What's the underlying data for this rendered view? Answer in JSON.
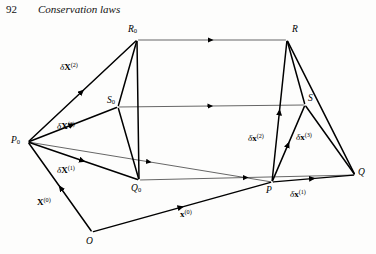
{
  "page": {
    "number": "92",
    "running_head": "Conservation laws",
    "background_color": "#fdfdfc",
    "ink_color": "#000000"
  },
  "figure": {
    "name": "deformation-parallelepiped-diagram",
    "type": "vector-diagram",
    "vertices": [
      {
        "id": "P0",
        "label": "P",
        "subscript": "0",
        "x": 28,
        "y": 142,
        "label_x": 11,
        "label_y": 136
      },
      {
        "id": "Q0",
        "label": "Q",
        "subscript": "0",
        "x": 139,
        "y": 180,
        "label_x": 131,
        "label_y": 184
      },
      {
        "id": "R0",
        "label": "R",
        "subscript": "0",
        "x": 137,
        "y": 40,
        "label_x": 128,
        "label_y": 25
      },
      {
        "id": "S0",
        "label": "S",
        "subscript": "0",
        "x": 118,
        "y": 107,
        "label_x": 107,
        "label_y": 96
      },
      {
        "id": "P",
        "label": "P",
        "subscript": "",
        "x": 272,
        "y": 182,
        "label_x": 266,
        "label_y": 186
      },
      {
        "id": "Q",
        "label": "Q",
        "subscript": "",
        "x": 355,
        "y": 175,
        "label_x": 358,
        "label_y": 168
      },
      {
        "id": "R",
        "label": "R",
        "subscript": "",
        "x": 287,
        "y": 40,
        "label_x": 292,
        "label_y": 25
      },
      {
        "id": "S",
        "label": "S",
        "subscript": "",
        "x": 305,
        "y": 105,
        "label_x": 308,
        "label_y": 94
      },
      {
        "id": "O",
        "label": "O",
        "subscript": "",
        "x": 92,
        "y": 232,
        "label_x": 86,
        "label_y": 237
      }
    ],
    "vector_labels": [
      {
        "id": "dX2",
        "delta": "δ",
        "symbol": "X",
        "superscript": "(2)",
        "x": 60,
        "y": 62,
        "bold": true
      },
      {
        "id": "dX3",
        "delta": "δ",
        "symbol": "X",
        "superscript": "(3)",
        "x": 57,
        "y": 121,
        "bold": true
      },
      {
        "id": "dX1",
        "delta": "δ",
        "symbol": "X",
        "superscript": "(1)",
        "x": 57,
        "y": 165,
        "bold": true
      },
      {
        "id": "X0",
        "delta": "",
        "symbol": "X",
        "superscript": "(0)",
        "x": 37,
        "y": 197,
        "bold": true
      },
      {
        "id": "dx2",
        "delta": "δ",
        "symbol": "x",
        "superscript": "(2)",
        "x": 248,
        "y": 133,
        "bold": true
      },
      {
        "id": "dx3",
        "delta": "δ",
        "symbol": "x",
        "superscript": "(3)",
        "x": 296,
        "y": 132,
        "bold": true
      },
      {
        "id": "dx1",
        "delta": "δ",
        "symbol": "x",
        "superscript": "(1)",
        "x": 290,
        "y": 189,
        "bold": true
      },
      {
        "id": "x0",
        "delta": "",
        "symbol": "x",
        "superscript": "(0)",
        "x": 180,
        "y": 209,
        "bold": true
      }
    ],
    "edges": [
      {
        "from": "P0",
        "to": "Q0",
        "style": "thick",
        "arrow": "mid"
      },
      {
        "from": "P0",
        "to": "R0",
        "style": "thick",
        "arrow": "mid"
      },
      {
        "from": "P0",
        "to": "S0",
        "style": "thick",
        "arrow": "mid"
      },
      {
        "from": "R0",
        "to": "Q0",
        "style": "thick",
        "arrow": "none"
      },
      {
        "from": "R0",
        "to": "S0",
        "style": "thick",
        "arrow": "none"
      },
      {
        "from": "S0",
        "to": "Q0",
        "style": "thick",
        "arrow": "none"
      },
      {
        "from": "O",
        "to": "P0",
        "style": "thick",
        "arrow": "mid"
      },
      {
        "from": "O",
        "to": "P",
        "style": "thick",
        "arrow": "mid"
      },
      {
        "from": "P",
        "to": "Q",
        "style": "thick",
        "arrow": "mid"
      },
      {
        "from": "P",
        "to": "R",
        "style": "thick",
        "arrow": "mid"
      },
      {
        "from": "P",
        "to": "S",
        "style": "thick",
        "arrow": "mid"
      },
      {
        "from": "R",
        "to": "Q",
        "style": "thick",
        "arrow": "none"
      },
      {
        "from": "R",
        "to": "S",
        "style": "thick",
        "arrow": "none"
      },
      {
        "from": "S",
        "to": "Q",
        "style": "thick",
        "arrow": "none"
      },
      {
        "from": "R0",
        "to": "R",
        "style": "thin",
        "arrow": "mid"
      },
      {
        "from": "S0",
        "to": "S",
        "style": "thin",
        "arrow": "mid"
      },
      {
        "from": "Q0",
        "to": "Q",
        "style": "thin",
        "arrow": "mid"
      },
      {
        "from": "P0",
        "to": "P",
        "style": "thin",
        "arrow": "mid"
      }
    ]
  }
}
